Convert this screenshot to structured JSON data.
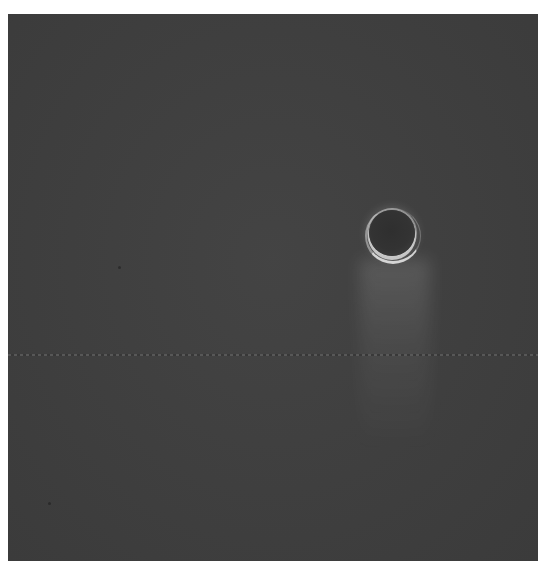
{
  "image": {
    "description": "Phase-contrast microscopy image of a single round cell on a dark gray background",
    "subject": "single cell",
    "colors": {
      "background": "#404040",
      "border": "#ffffff",
      "cell_interior": "#2f2f2f",
      "cell_rim": "#ebebeb"
    }
  }
}
